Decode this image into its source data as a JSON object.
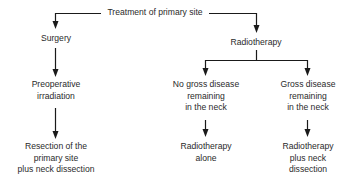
{
  "root": {
    "label": "Treatment of primary site"
  },
  "branches": {
    "surgery": {
      "label": "Surgery",
      "step1": "Preoperative\nirradiation",
      "step1_lines": [
        "Preoperative",
        "irradiation"
      ],
      "outcome_lines": [
        "Resection of the",
        "primary site",
        "plus neck dissection"
      ]
    },
    "radiotherapy": {
      "label": "Radiotherapy",
      "no_gross": {
        "condition_lines": [
          "No gross disease",
          "remaining",
          "in the neck"
        ],
        "outcome_lines": [
          "Radiotherapy",
          "alone"
        ]
      },
      "gross": {
        "condition_lines": [
          "Gross disease",
          "remaining",
          "in the neck"
        ],
        "outcome_lines": [
          "Radiotherapy",
          "plus neck",
          "dissection"
        ]
      }
    }
  },
  "colors": {
    "line": "#1a1a1a",
    "text": "#2a2a2a",
    "background": "#ffffff"
  }
}
